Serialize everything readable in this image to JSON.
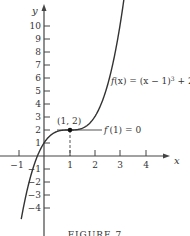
{
  "chart_data": {
    "type": "line",
    "title": "",
    "caption": "FIGURE 7",
    "xlabel": "x",
    "ylabel": "y",
    "xlim": [
      -1.5,
      4.8
    ],
    "ylim": [
      -5.8,
      11.5
    ],
    "grid": false,
    "x_ticks": [
      -1,
      1,
      2,
      3,
      4
    ],
    "y_ticks": [
      -4,
      -3,
      -2,
      -1,
      1,
      2,
      3,
      4,
      5,
      6,
      7,
      8,
      9,
      10
    ],
    "x_tick_labels": [
      "−1",
      "1",
      "2",
      "3",
      "4"
    ],
    "y_tick_labels": [
      "−4",
      "−3",
      "−2",
      "−1",
      "1",
      "2",
      "3",
      "4",
      "5",
      "6",
      "7",
      "8",
      "9",
      "10"
    ],
    "series": [
      {
        "name": "f(x) = (x − 1)³ + 2",
        "function": "(x-1)^3+2",
        "x": [
          -0.88,
          -0.5,
          0,
          0.5,
          1,
          1.5,
          2,
          2.5,
          3,
          3.16
        ],
        "values": [
          -4.64,
          -1.38,
          1,
          1.88,
          2,
          2.13,
          3,
          5.38,
          10,
          12.08
        ]
      }
    ],
    "annotations": [
      {
        "text": "(1, 2)",
        "x": 1,
        "y": 2,
        "type": "point"
      },
      {
        "text": "f′(1) = 0",
        "type": "tangent-line",
        "y": 2,
        "x_range": [
          0.5,
          2.3
        ]
      },
      {
        "text": "f(x) = (x − 1)³ + 2",
        "type": "curve-label"
      }
    ],
    "dashed_guide": {
      "x": 1,
      "from_y": 0,
      "to_y": 2
    }
  },
  "labels": {
    "x_axis": "x",
    "y_axis": "y",
    "point": "(1, 2)",
    "derivative": "f′(1) = 0",
    "function_f": "f",
    "function_rest": "(x) = (x − 1)",
    "function_exp": "3",
    "function_tail": " + 2",
    "caption": "FIGURE 7",
    "ticks_x": [
      "−1",
      "1",
      "2",
      "3",
      "4"
    ],
    "ticks_y": [
      "10",
      "9",
      "8",
      "7",
      "6",
      "5",
      "4",
      "3",
      "2",
      "1",
      "−1",
      "−2",
      "−3",
      "−4"
    ]
  }
}
